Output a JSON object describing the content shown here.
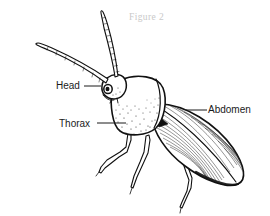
{
  "figure": {
    "caption": "Figure 2",
    "background_color": "#ffffff",
    "ink_color": "#111111",
    "caption_color": "#c9c9c9",
    "label_color": "#1a1a1a"
  },
  "labels": [
    {
      "id": "head",
      "text": "Head",
      "text_x": 56,
      "text_y": 89,
      "leader_x1": 84,
      "leader_y1": 86,
      "leader_x2": 101,
      "leader_y2": 86
    },
    {
      "id": "thorax",
      "text": "Thorax",
      "text_x": 59,
      "text_y": 127,
      "leader_x1": 97,
      "leader_y1": 123,
      "leader_x2": 126,
      "leader_y2": 123
    },
    {
      "id": "abdomen",
      "text": "Abdomen",
      "text_x": 208,
      "text_y": 113,
      "leader_x1": 186,
      "leader_y1": 110,
      "leader_x2": 207,
      "leader_y2": 110
    }
  ],
  "anatomy_parts": [
    {
      "name": "left-antenna",
      "description": "long curved tapering antenna sweeping up-left"
    },
    {
      "name": "right-antenna",
      "description": "long segmented antenna sweeping up-right"
    },
    {
      "name": "head",
      "description": "small rounded head with dark compound eye"
    },
    {
      "name": "thorax",
      "description": "rounded pronotum with stippled shading"
    },
    {
      "name": "abdomen",
      "description": "elongated elytra with fine longitudinal striations"
    },
    {
      "name": "scutellum",
      "description": "dark triangular wedge at elytra junction"
    },
    {
      "name": "legs",
      "description": "three visible jointed legs"
    }
  ]
}
